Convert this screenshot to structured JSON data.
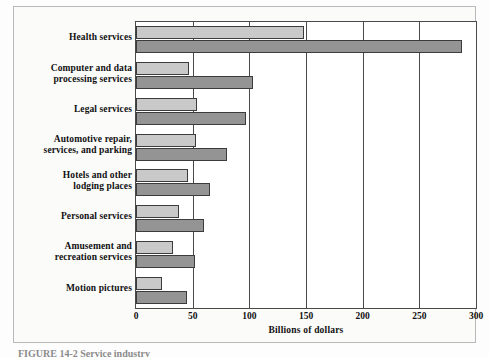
{
  "figure": {
    "caption": "FIGURE 14-2   Service industry",
    "background_color": "#fbfbfa",
    "frame_color": "#b9b9b9"
  },
  "chart_data": {
    "type": "bar",
    "orientation": "horizontal",
    "title": "",
    "subtitle": "",
    "xlabel": "Billions of dollars",
    "ylabel": "",
    "xlim": [
      0,
      300
    ],
    "xticks": [
      0,
      50,
      100,
      150,
      200,
      250,
      300
    ],
    "xticklabels": [
      "0",
      "50",
      "100",
      "150",
      "200",
      "250",
      "300"
    ],
    "grid": true,
    "grid_axis": "x",
    "legend": false,
    "legend_position": "none",
    "categories": [
      "Health services",
      "Computer and data processing services",
      "Legal services",
      "Automotive repair, services, and parking",
      "Hotels and other lodging places",
      "Personal services",
      "Amusement and recreation services",
      "Motion pictures"
    ],
    "category_label_lines": [
      [
        "Health services"
      ],
      [
        "Computer and data",
        "processing services"
      ],
      [
        "Legal services"
      ],
      [
        "Automotive repair,",
        "services, and parking"
      ],
      [
        "Hotels and other",
        "lodging places"
      ],
      [
        "Personal services"
      ],
      [
        "Amusement and",
        "recreation services"
      ],
      [
        "Motion pictures"
      ]
    ],
    "series": [
      {
        "name": "light",
        "color": "#c9c9c9",
        "values": [
          148,
          47,
          54,
          53,
          46,
          38,
          33,
          23
        ]
      },
      {
        "name": "dark",
        "color": "#949494",
        "values": [
          288,
          103,
          97,
          80,
          65,
          60,
          52,
          45
        ]
      }
    ]
  }
}
